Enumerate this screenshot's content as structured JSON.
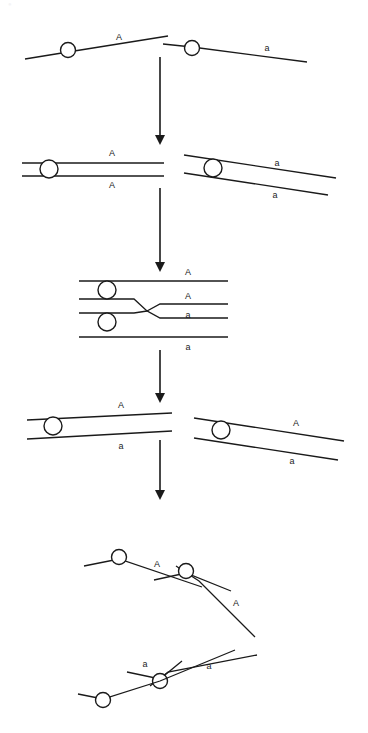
{
  "figure": {
    "title": "Crossing over between homologous chromosomes",
    "watermark_text": "",
    "background_color": "#ffffff",
    "ink_color": "#1a1a1a",
    "width": 368,
    "height": 733
  },
  "alleles": {
    "dominant": "A",
    "recessive": "a"
  },
  "stages": [
    {
      "id": "stage-1-homologous-chromosomes",
      "name": "Homologous chromosomes before replication",
      "chromosomes": [
        {
          "id": "chrom-1-left",
          "allele_labels": [
            {
              "text": "A",
              "x": 119,
              "y": 38
            }
          ],
          "centromere": {
            "cx": 68,
            "cy": 50,
            "r": 7.5
          },
          "strands": [
            {
              "points": "25,59 68,52 168,36",
              "width": 1.3
            }
          ]
        },
        {
          "id": "chrom-1-right",
          "allele_labels": [
            {
              "text": "a",
              "x": 267,
              "y": 49
            }
          ],
          "centromere": {
            "cx": 192,
            "cy": 48,
            "r": 7.5
          },
          "strands": [
            {
              "points": "163,44 192,47 307,62",
              "width": 1.3
            }
          ]
        }
      ]
    },
    {
      "id": "stage-2-replicated-sister-chromatids",
      "name": "Replicated chromosomes with sister chromatids",
      "chromosomes": [
        {
          "id": "chrom-2-left",
          "allele_labels": [
            {
              "text": "A",
              "x": 112,
              "y": 154
            },
            {
              "text": "A",
              "x": 112,
              "y": 186
            }
          ],
          "centromere": {
            "cx": 49,
            "cy": 169,
            "r": 9
          },
          "strands": [
            {
              "points": "22,163 164,163",
              "width": 1.3
            },
            {
              "points": "22,176 164,176",
              "width": 1.3
            }
          ]
        },
        {
          "id": "chrom-2-right",
          "allele_labels": [
            {
              "text": "a",
              "x": 277,
              "y": 164
            },
            {
              "text": "a",
              "x": 275,
              "y": 196
            },
            {
              "text": "",
              "x": 0,
              "y": 0
            }
          ],
          "centromere": {
            "cx": 213,
            "cy": 168,
            "r": 9
          },
          "strands": [
            {
              "points": "184,155 336,178",
              "width": 1.3
            },
            {
              "points": "184,173 328,195",
              "width": 1.3
            }
          ]
        }
      ]
    },
    {
      "id": "stage-3-synapsis-crossing-over",
      "name": "Synapsis and crossing over at chiasma",
      "chromosomes": [
        {
          "id": "chrom-3-bivalent",
          "allele_labels": [
            {
              "text": "A",
              "x": 188,
              "y": 273
            },
            {
              "text": "A",
              "x": 188,
              "y": 297
            },
            {
              "text": "a",
              "x": 188,
              "y": 316
            },
            {
              "text": "a",
              "x": 188,
              "y": 348
            }
          ],
          "centromeres": [
            {
              "cx": 107,
              "cy": 290,
              "r": 9
            },
            {
              "cx": 107,
              "cy": 322,
              "r": 9
            }
          ],
          "strands": [
            {
              "points": "79,281 228,281",
              "width": 1.3
            },
            {
              "points": "79,299 134,299 147,311 160,304 228,304",
              "width": 1.3
            },
            {
              "points": "79,313 134,313 147,311 160,318 228,318",
              "width": 1.3
            },
            {
              "points": "79,337 228,337",
              "width": 1.3
            }
          ]
        }
      ]
    },
    {
      "id": "stage-4-recombinant-chromosomes",
      "name": "Recombinant chromosomes after crossover",
      "chromosomes": [
        {
          "id": "chrom-4-left",
          "allele_labels": [
            {
              "text": "A",
              "x": 121,
              "y": 406
            },
            {
              "text": "a",
              "x": 121,
              "y": 447
            }
          ],
          "centromere": {
            "cx": 53,
            "cy": 426,
            "r": 9
          },
          "strands": [
            {
              "points": "27,420 172,413",
              "width": 1.3
            },
            {
              "points": "27,439 172,431",
              "width": 1.3
            }
          ]
        },
        {
          "id": "chrom-4-right",
          "allele_labels": [
            {
              "text": "A",
              "x": 296,
              "y": 424
            },
            {
              "text": "a",
              "x": 292,
              "y": 462
            }
          ],
          "centromere": {
            "cx": 221,
            "cy": 430,
            "r": 9
          },
          "strands": [
            {
              "points": "194,418 344,441",
              "width": 1.3
            },
            {
              "points": "194,438 338,460",
              "width": 1.3
            }
          ]
        }
      ]
    },
    {
      "id": "stage-5-separated-chromatids",
      "name": "Separated chromatids in gametes",
      "chromosomes": [
        {
          "id": "chrom-5-upper-parental",
          "allele_labels": [
            {
              "text": "A",
              "x": 157,
              "y": 565
            }
          ],
          "centromere": {
            "cx": 119,
            "cy": 557,
            "r": 7.5
          },
          "strands": [
            {
              "points": "84,566 119,559 202,587",
              "width": 1.3
            }
          ]
        },
        {
          "id": "chrom-5-upper-recombinant",
          "allele_labels": [
            {
              "text": "A",
              "x": 236,
              "y": 604
            }
          ],
          "centromere": {
            "cx": 186,
            "cy": 571,
            "r": 7.5
          },
          "strands": [
            {
              "points": "154,580 186,573 231,591",
              "width": 1.3
            },
            {
              "points": "176,566 199,581 255,637",
              "width": 1.3
            }
          ]
        },
        {
          "id": "chrom-5-lower-recombinant",
          "allele_labels": [
            {
              "text": "a",
              "x": 145,
              "y": 665
            }
          ],
          "centromere": {
            "cx": 160,
            "cy": 681,
            "r": 7.5
          },
          "strands": [
            {
              "points": "127,672 160,679 182,661",
              "width": 1.3
            },
            {
              "points": "150,686 168,672 257,655",
              "width": 1.3
            }
          ]
        },
        {
          "id": "chrom-5-lower-parental",
          "allele_labels": [
            {
              "text": "a",
              "x": 209,
              "y": 667
            }
          ],
          "centromere": {
            "cx": 103,
            "cy": 700,
            "r": 7.5
          },
          "strands": [
            {
              "points": "78,694 103,699 160,681 235,650",
              "width": 1.3
            }
          ]
        }
      ]
    }
  ],
  "arrows": [
    {
      "id": "arrow-1",
      "label": "stage 1 to stage 2",
      "x": 160,
      "y1": 57,
      "y2": 145
    },
    {
      "id": "arrow-2",
      "label": "stage 2 to stage 3",
      "x": 160,
      "y1": 188,
      "y2": 272
    },
    {
      "id": "arrow-3",
      "label": "stage 3 to stage 4",
      "x": 160,
      "y1": 350,
      "y2": 403
    },
    {
      "id": "arrow-4",
      "label": "stage 4 to stage 5",
      "x": 160,
      "y1": 440,
      "y2": 500
    }
  ]
}
